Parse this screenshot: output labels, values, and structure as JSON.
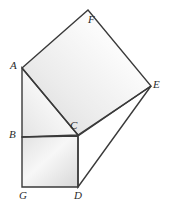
{
  "figure": {
    "type": "geometry-diagram",
    "caption": "",
    "width": 169,
    "height": 207,
    "background_color": "#ffffff",
    "stroke_color": "#3a3a3a",
    "fill_light": "#fdfdfd",
    "fill_shade": "#dcdcdc"
  },
  "points": {
    "A": {
      "label": "A",
      "x": 22,
      "y": 68,
      "label_x": 10,
      "label_y": 60
    },
    "B": {
      "label": "B",
      "x": 22,
      "y": 137,
      "label_x": 9,
      "label_y": 129
    },
    "C": {
      "label": "C",
      "x": 78,
      "y": 135,
      "label_x": 70,
      "label_y": 120
    },
    "D": {
      "label": "D",
      "x": 78,
      "y": 187,
      "label_x": 74,
      "label_y": 190
    },
    "E": {
      "label": "E",
      "x": 151,
      "y": 86,
      "label_x": 153,
      "label_y": 79
    },
    "F": {
      "label": "F",
      "x": 88,
      "y": 10,
      "label_x": 88,
      "label_y": 14
    },
    "G": {
      "label": "G",
      "x": 22,
      "y": 187,
      "label_x": 19,
      "label_y": 190
    }
  },
  "shapes": [
    {
      "name": "square-on-hypotenuse-ACEF",
      "vertices": "A,F,E,C",
      "points": "22,68 88,10 151,86 78,135",
      "fill": "gradient-square-large"
    },
    {
      "name": "square-on-leg-BGDC",
      "vertices": "B,C,D,G",
      "points": "22,137 78,136 78,187 22,187",
      "fill": "gradient-square-small"
    },
    {
      "name": "right-triangle-ABC",
      "vertices": "A,B,C",
      "points": "22,68 22,137 78,135",
      "fill": "gradient-triangle"
    },
    {
      "name": "triangle-CDE",
      "vertices": "C,E,D",
      "points": "78,136 151,86 78,187",
      "fill": "none"
    }
  ],
  "segments": [
    {
      "name": "segment-AF",
      "from": "A",
      "to": "F"
    },
    {
      "name": "segment-FE",
      "from": "F",
      "to": "E"
    },
    {
      "name": "segment-EC",
      "from": "E",
      "to": "C"
    },
    {
      "name": "segment-CA",
      "from": "C",
      "to": "A"
    },
    {
      "name": "segment-AB",
      "from": "A",
      "to": "B"
    },
    {
      "name": "segment-BC",
      "from": "B",
      "to": "C"
    },
    {
      "name": "segment-BG",
      "from": "B",
      "to": "G"
    },
    {
      "name": "segment-GD",
      "from": "G",
      "to": "D"
    },
    {
      "name": "segment-DC",
      "from": "D",
      "to": "C"
    },
    {
      "name": "segment-DE",
      "from": "D",
      "to": "E"
    }
  ]
}
